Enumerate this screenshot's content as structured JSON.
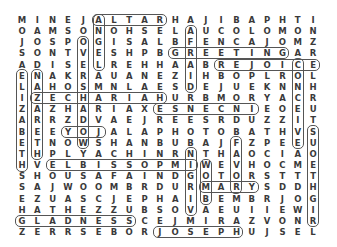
{
  "puzzle": {
    "type": "word-search",
    "rows": 20,
    "cols": 20,
    "grid": [
      "MINEJALTARHAJIBAPHTI",
      "OAMSONOHSELAUCOLOMON",
      "JOSPOGISALBFENCAJOMZ",
      "SONTVESHPBGREETINGAR",
      "ADISELREHHAABREJOICE",
      "ENAKRAUANEZIHBOPLROL",
      "LAHOSMNLAESDEJUEKNNH",
      "IZECHARIAHURBMORYACR",
      "ZAZHARIAXESNECNIEOEU",
      "ARRZDVAEJREESRDUZZIT",
      "BEEYOJALAPHOTOBATHVS",
      "ETNOWSHANBUBAJFZPEEU",
      "THPLYACHINRNTHAOCIAO",
      "HVELBISSOPMIWEVHOCME",
      "SHOUSAFAINDGOTORSTTT",
      "SAJWOOMBRDURMARYSDDH",
      "EZUASCJEPHAIBEMBRJOG",
      "HATHEZZUBSOVAEUIIEWI",
      "GLADNESSCEJMIRAZVONR",
      "ZERRSEBORJOSEPHUJSEL"
    ],
    "found_words": [
      {
        "word": "ALTAR",
        "row": 1,
        "col": 6,
        "dir": "h",
        "len": 5
      },
      {
        "word": "ANGEL",
        "row": 1,
        "col": 6,
        "dir": "v",
        "len": 5
      },
      {
        "word": "OVERSHADOW",
        "row": 3,
        "col": 5,
        "dir": "v",
        "len": 10
      },
      {
        "word": "AFRAID",
        "row": 2,
        "col": 12,
        "dir": "v",
        "len": 6
      },
      {
        "word": "GREETING",
        "row": 4,
        "col": 11,
        "dir": "h",
        "len": 8
      },
      {
        "word": "REJOICE",
        "row": 5,
        "col": 14,
        "dir": "h",
        "len": 7
      },
      {
        "word": "CONCEIVE",
        "row": 5,
        "col": 19,
        "dir": "v",
        "len": 8
      },
      {
        "word": "ELIZABETH",
        "row": 6,
        "col": 1,
        "dir": "v",
        "len": 9
      },
      {
        "word": "NAZARETH",
        "row": 6,
        "col": 2,
        "dir": "v",
        "len": 8
      },
      {
        "word": "ZECHARIAH",
        "row": 8,
        "col": 2,
        "dir": "h",
        "len": 9
      },
      {
        "word": "INCENSE",
        "row": 9,
        "col": 10,
        "dir": "h",
        "len": 7
      },
      {
        "word": "JOY",
        "row": 11,
        "col": 4,
        "dir": "h",
        "len": 3
      },
      {
        "word": "RIGHTEOUS",
        "row": 11,
        "col": 20,
        "dir": "v",
        "len": 9
      },
      {
        "word": "FAVOR",
        "row": 12,
        "col": 15,
        "dir": "v",
        "len": 5
      },
      {
        "word": "VIRGIN",
        "row": 13,
        "col": 12,
        "dir": "v",
        "len": 6
      },
      {
        "word": "IMPOSSIBLE",
        "row": 14,
        "col": 3,
        "dir": "h",
        "len": 10
      },
      {
        "word": "WOMB",
        "row": 14,
        "col": 13,
        "dir": "v",
        "len": 4
      },
      {
        "word": "MARY",
        "row": 16,
        "col": 13,
        "dir": "h",
        "len": 4
      },
      {
        "word": "GLADNESS",
        "row": 19,
        "col": 1,
        "dir": "h",
        "len": 8
      },
      {
        "word": "JOSEPH",
        "row": 20,
        "col": 10,
        "dir": "h",
        "len": 6
      }
    ],
    "colors": {
      "letter": "#3a3a3a",
      "outline": "#555555",
      "background": "#ffffff"
    }
  }
}
